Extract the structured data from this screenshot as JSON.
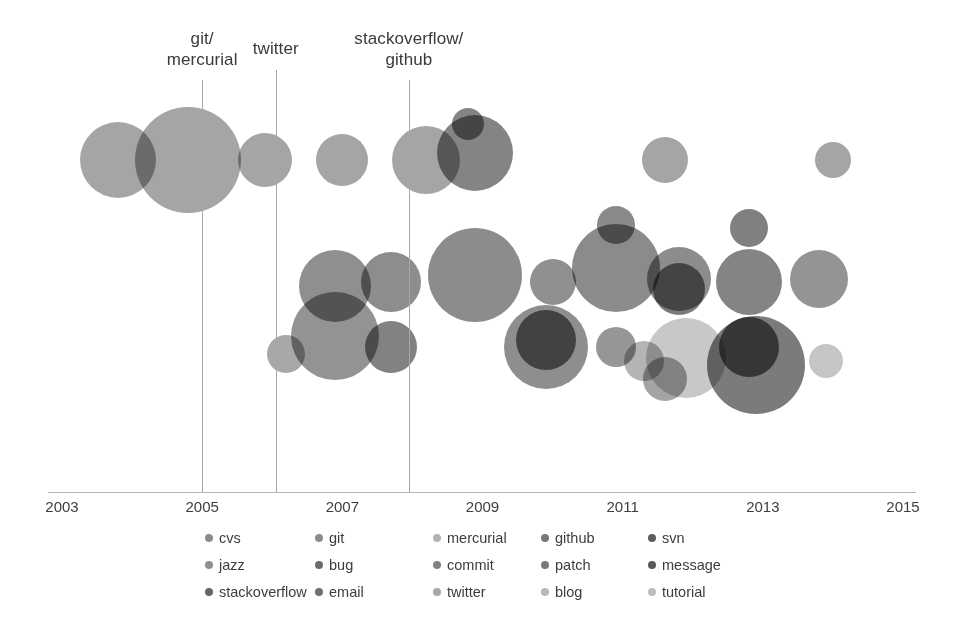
{
  "chart_data": {
    "type": "scatter",
    "title": "",
    "xlabel": "",
    "ylabel": "",
    "xlim": [
      2003,
      2015
    ],
    "x_ticks": [
      "2003",
      "2005",
      "2007",
      "2009",
      "2011",
      "2013",
      "2015"
    ],
    "grid": false,
    "legend_position": "bottom",
    "note": "Bubble / scatter timeline chart. Bubble area encodes volume; vertical position separates two bands (upper band = earlier tools, lower band = main cluster). Rendered grayscale with multiply blending so overlaps darken.",
    "series": [
      {
        "name": "cvs",
        "color": "#878787"
      },
      {
        "name": "git",
        "color": "#8a8a8a"
      },
      {
        "name": "mercurial",
        "color": "#b0b0b0"
      },
      {
        "name": "github",
        "color": "#737373"
      },
      {
        "name": "svn",
        "color": "#5e5e5e"
      },
      {
        "name": "jazz",
        "color": "#8f8f8f"
      },
      {
        "name": "bug",
        "color": "#6b6b6b"
      },
      {
        "name": "commit",
        "color": "#828282"
      },
      {
        "name": "patch",
        "color": "#7a7a7a"
      },
      {
        "name": "message",
        "color": "#5a5a5a"
      },
      {
        "name": "stackoverflow",
        "color": "#666666"
      },
      {
        "name": "email",
        "color": "#6f6f6f"
      },
      {
        "name": "twitter",
        "color": "#a6a6a6"
      },
      {
        "name": "blog",
        "color": "#b8b8b8"
      },
      {
        "name": "tutorial",
        "color": "#bdbdbd"
      }
    ],
    "points": [
      {
        "label": "cvs",
        "x": 2003.8,
        "y": 0.82,
        "r": 38,
        "color": "#8c8c8c"
      },
      {
        "label": "cvs",
        "x": 2004.8,
        "y": 0.82,
        "r": 53,
        "color": "#8c8c8c"
      },
      {
        "label": "cvs",
        "x": 2005.9,
        "y": 0.82,
        "r": 27,
        "color": "#8c8c8c"
      },
      {
        "label": "cvs",
        "x": 2007.0,
        "y": 0.82,
        "r": 26,
        "color": "#8c8c8c"
      },
      {
        "label": "cvs",
        "x": 2008.2,
        "y": 0.82,
        "r": 34,
        "color": "#8c8c8c"
      },
      {
        "label": "svn",
        "x": 2008.9,
        "y": 0.84,
        "r": 38,
        "color": "#616161"
      },
      {
        "label": "svn",
        "x": 2008.8,
        "y": 0.92,
        "r": 16,
        "color": "#616161"
      },
      {
        "label": "cvs",
        "x": 2011.6,
        "y": 0.82,
        "r": 23,
        "color": "#8c8c8c"
      },
      {
        "label": "cvs",
        "x": 2014.0,
        "y": 0.82,
        "r": 18,
        "color": "#8c8c8c"
      },
      {
        "label": "jazz",
        "x": 2006.2,
        "y": 0.28,
        "r": 19,
        "color": "#8f8f8f"
      },
      {
        "label": "bug",
        "x": 2006.9,
        "y": 0.47,
        "r": 36,
        "color": "#6f6f6f"
      },
      {
        "label": "commit",
        "x": 2006.9,
        "y": 0.33,
        "r": 44,
        "color": "#757575"
      },
      {
        "label": "patch",
        "x": 2007.7,
        "y": 0.48,
        "r": 30,
        "color": "#6d6d6d"
      },
      {
        "label": "message",
        "x": 2007.7,
        "y": 0.3,
        "r": 26,
        "color": "#5f5f5f"
      },
      {
        "label": "stackoverflow",
        "x": 2008.9,
        "y": 0.5,
        "r": 47,
        "color": "#6b6b6b"
      },
      {
        "label": "email",
        "x": 2010.0,
        "y": 0.48,
        "r": 23,
        "color": "#707070"
      },
      {
        "label": "github",
        "x": 2009.9,
        "y": 0.3,
        "r": 42,
        "color": "#6e6e6e"
      },
      {
        "label": "svn",
        "x": 2009.9,
        "y": 0.32,
        "r": 30,
        "color": "#4f4f4f"
      },
      {
        "label": "commit",
        "x": 2010.9,
        "y": 0.52,
        "r": 44,
        "color": "#6a6a6a"
      },
      {
        "label": "bug",
        "x": 2010.9,
        "y": 0.64,
        "r": 19,
        "color": "#676767"
      },
      {
        "label": "patch",
        "x": 2010.9,
        "y": 0.3,
        "r": 20,
        "color": "#787878"
      },
      {
        "label": "github",
        "x": 2011.8,
        "y": 0.49,
        "r": 32,
        "color": "#6c6c6c"
      },
      {
        "label": "svn",
        "x": 2011.8,
        "y": 0.46,
        "r": 26,
        "color": "#565656"
      },
      {
        "label": "tutorial",
        "x": 2011.9,
        "y": 0.27,
        "r": 40,
        "color": "#b9b9b9"
      },
      {
        "label": "twitter",
        "x": 2011.3,
        "y": 0.26,
        "r": 20,
        "color": "#9f9f9f"
      },
      {
        "label": "blog",
        "x": 2011.6,
        "y": 0.21,
        "r": 22,
        "color": "#8a8a8a"
      },
      {
        "label": "message",
        "x": 2012.8,
        "y": 0.63,
        "r": 19,
        "color": "#5c5c5c"
      },
      {
        "label": "github",
        "x": 2012.8,
        "y": 0.48,
        "r": 33,
        "color": "#616161"
      },
      {
        "label": "stackoverflow",
        "x": 2012.9,
        "y": 0.25,
        "r": 49,
        "color": "#555555"
      },
      {
        "label": "message",
        "x": 2012.8,
        "y": 0.3,
        "r": 30,
        "color": "#464646"
      },
      {
        "label": "commit",
        "x": 2013.8,
        "y": 0.49,
        "r": 29,
        "color": "#767676"
      },
      {
        "label": "blog",
        "x": 2013.9,
        "y": 0.26,
        "r": 17,
        "color": "#b5b5b5"
      }
    ],
    "annotations": [
      {
        "text": "git/\nmercurial",
        "x": 2005.0,
        "label_top": 28,
        "line_top": 80,
        "line_bottom": 492
      },
      {
        "text": "twitter",
        "x": 2006.05,
        "label_top": 38,
        "line_top": 70,
        "line_bottom": 492
      },
      {
        "text": "stackoverflow/\ngithub",
        "x": 2007.95,
        "label_top": 28,
        "line_top": 80,
        "line_bottom": 492
      }
    ]
  },
  "legend": {
    "rows": [
      [
        {
          "label": "cvs",
          "color": "#8c8c8c"
        },
        {
          "label": "git",
          "color": "#8c8c8c"
        },
        {
          "label": "mercurial",
          "color": "#b3b3b3"
        },
        {
          "label": "github",
          "color": "#787878"
        },
        {
          "label": "svn",
          "color": "#5e5e5e"
        }
      ],
      [
        {
          "label": "jazz",
          "color": "#8f8f8f"
        },
        {
          "label": "bug",
          "color": "#6b6b6b"
        },
        {
          "label": "commit",
          "color": "#828282"
        },
        {
          "label": "patch",
          "color": "#7a7a7a"
        },
        {
          "label": "message",
          "color": "#5a5a5a"
        }
      ],
      [
        {
          "label": "stackoverflow",
          "color": "#666666"
        },
        {
          "label": "email",
          "color": "#6f6f6f"
        },
        {
          "label": "twitter",
          "color": "#a6a6a6"
        },
        {
          "label": "blog",
          "color": "#b8b8b8"
        },
        {
          "label": "tutorial",
          "color": "#bdbdbd"
        }
      ]
    ]
  }
}
